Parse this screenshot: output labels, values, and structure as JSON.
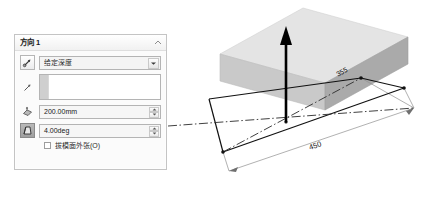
{
  "panel": {
    "title": "方向 1",
    "collapse_icon": "chevron-up-icon",
    "end_condition": {
      "reverse_icon": "reverse-direction-icon",
      "value": "给定深度",
      "dropdown_icon": "chevron-down-icon"
    },
    "direction_reference": {
      "icon": "direction-arrow-icon",
      "value": "",
      "placeholder": ""
    },
    "depth": {
      "icon": "depth-icon",
      "value": "200.00mm",
      "spinner_up_icon": "spin-up-icon",
      "spinner_down_icon": "spin-down-icon"
    },
    "draft": {
      "icon": "draft-angle-icon",
      "value": "4.00deg",
      "spinner_up_icon": "spin-up-icon",
      "spinner_down_icon": "spin-down-icon",
      "active": true
    },
    "draft_outward": {
      "checked": false,
      "label": "拔模面外张(O)"
    }
  },
  "viewport": {
    "extrude_arrow_icon": "extrude-direction-arrow",
    "dimensions": [
      {
        "name": "width-dimension",
        "label": "355"
      },
      {
        "name": "length-dimension",
        "label": "450"
      }
    ],
    "colors": {
      "face_top": "#e3e3e3",
      "face_left": "#c8c8c8",
      "face_right": "#a9a9a9",
      "sketch_line": "#111111",
      "centerline": "#333333",
      "dimension_line": "#8a8a8a"
    }
  }
}
